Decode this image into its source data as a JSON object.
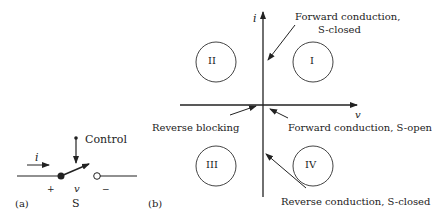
{
  "panel_a": {
    "label": "(a)",
    "switch_name": "S",
    "control_label": "Control",
    "current_label": "i",
    "voltage_label": "v",
    "plus": "+",
    "minus": "−"
  },
  "panel_b": {
    "label": "(b)",
    "axis_y_label": "i",
    "axis_x_label": "v",
    "quadrants": [
      "I",
      "II",
      "III",
      "IV"
    ],
    "annotations": {
      "forward_closed_1": "Forward conduction,",
      "forward_closed_2": "S-closed",
      "forward_open": "Forward conduction, S-open",
      "reverse_blocking": "Reverse blocking",
      "reverse_closed": "Reverse conduction, S-closed"
    }
  }
}
